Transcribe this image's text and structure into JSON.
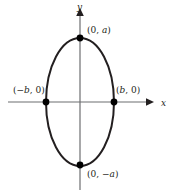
{
  "figure": {
    "colors": {
      "curve": "#231f20",
      "axis": "#6d6e71",
      "point": "#000000",
      "background": "#ffffff",
      "text": "#231f20"
    },
    "axes": {
      "x_label": "x",
      "y_label": "y",
      "x_axis_y_px": 102,
      "x_axis_start_px": 8,
      "x_axis_end_px": 152,
      "y_axis_x_px": 80,
      "y_axis_start_px": 8,
      "y_axis_end_px": 190,
      "arrowheads": [
        "x-positive",
        "y-positive"
      ]
    },
    "ellipse": {
      "center": [
        80,
        102
      ],
      "semi_axis_x_px": 34,
      "semi_axis_y_px": 64,
      "stroke_width_px": 2
    },
    "points": [
      {
        "name": "top-vertex",
        "label": "(0, a)",
        "label_plain": "(0, a)",
        "cx": 80,
        "cy": 38
      },
      {
        "name": "bottom-vertex",
        "label": "(0, −a)",
        "label_plain": "(0, -a)",
        "cx": 80,
        "cy": 165
      },
      {
        "name": "left-vertex",
        "label": "(−b, 0)",
        "label_plain": "(-b, 0)",
        "cx": 46,
        "cy": 102
      },
      {
        "name": "right-vertex",
        "label": "(b, 0)",
        "label_plain": "(b, 0)",
        "cx": 114,
        "cy": 102
      }
    ],
    "labels": {
      "top": {
        "open": "(0, ",
        "var": "a",
        "close": ")"
      },
      "bottom": {
        "open": "(0, −",
        "var": "a",
        "close": ")"
      },
      "left": {
        "open": "(−",
        "var": "b",
        "close": ", 0)"
      },
      "right": {
        "open": "(",
        "var": "b",
        "close": ", 0)"
      }
    }
  }
}
